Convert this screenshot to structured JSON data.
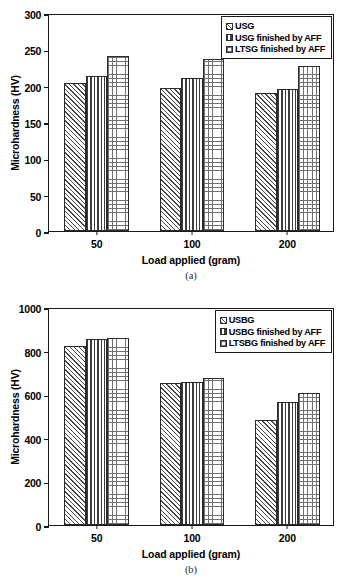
{
  "figure": {
    "panels": [
      {
        "tag": "(a)",
        "ylabel": "Microhardness (HV)",
        "xlabel": "Load applied (gram)",
        "yticks": [
          0,
          50,
          100,
          150,
          200,
          250,
          300
        ],
        "xticks": [
          "50",
          "100",
          "200"
        ],
        "legend": [
          {
            "label": "USG",
            "pattern": "pat-diag"
          },
          {
            "label": "USG finished by AFF",
            "pattern": "pat-vert"
          },
          {
            "label": "LTSG finished by AFF",
            "pattern": "pat-grid"
          }
        ]
      },
      {
        "tag": "(b)",
        "ylabel": "Microhardness (HV)",
        "xlabel": "Load applied (gram)",
        "yticks": [
          0,
          200,
          400,
          600,
          800,
          1000
        ],
        "xticks": [
          "50",
          "100",
          "200"
        ],
        "legend": [
          {
            "label": "USBG",
            "pattern": "pat-diag"
          },
          {
            "label": "USBG finished by AFF",
            "pattern": "pat-vert"
          },
          {
            "label": "LTSBG finished by AFF",
            "pattern": "pat-grid"
          }
        ]
      }
    ]
  },
  "chart_data": [
    {
      "type": "bar",
      "title": "(a)",
      "xlabel": "Load applied (gram)",
      "ylabel": "Microhardness (HV)",
      "categories": [
        "50",
        "100",
        "200"
      ],
      "ylim": [
        0,
        300
      ],
      "ytick_step": 50,
      "grid": false,
      "legend_position": "top-right",
      "series": [
        {
          "name": "USG",
          "values": [
            204,
            197,
            190
          ]
        },
        {
          "name": "USG finished by AFF",
          "values": [
            213,
            210,
            196
          ]
        },
        {
          "name": "LTSG finished by AFF",
          "values": [
            241,
            237,
            227
          ]
        }
      ]
    },
    {
      "type": "bar",
      "title": "(b)",
      "xlabel": "Load applied (gram)",
      "ylabel": "Microhardness (HV)",
      "categories": [
        "50",
        "100",
        "200"
      ],
      "ylim": [
        0,
        1000
      ],
      "ytick_step": 200,
      "grid": false,
      "legend_position": "top-right",
      "series": [
        {
          "name": "USBG",
          "values": [
            822,
            650,
            482
          ]
        },
        {
          "name": "USBG finished by AFF",
          "values": [
            855,
            655,
            562
          ]
        },
        {
          "name": "LTSBG finished by AFF",
          "values": [
            860,
            673,
            605
          ]
        }
      ]
    }
  ]
}
